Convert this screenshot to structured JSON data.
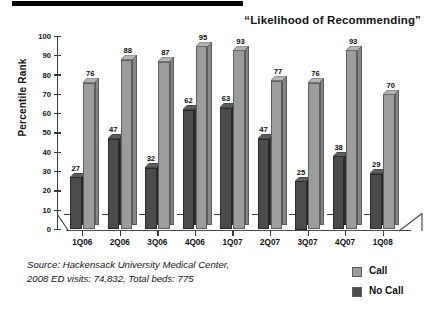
{
  "top_rule": {
    "present": true,
    "color": "#000000"
  },
  "chart_data": {
    "type": "bar",
    "title": "“Likelihood of Recommending”",
    "xlabel": "",
    "ylabel": "Percentile Rank",
    "ylim": [
      0,
      100
    ],
    "ytick_step": 10,
    "yticks": [
      "100",
      "90",
      "80",
      "70",
      "60",
      "50",
      "40",
      "30",
      "20",
      "10",
      "0"
    ],
    "grid": false,
    "legend_position": "bottom-right",
    "three_d": true,
    "categories": [
      "1Q06",
      "2Q06",
      "3Q06",
      "4Q06",
      "1Q07",
      "2Q07",
      "3Q07",
      "4Q07",
      "1Q08"
    ],
    "series": [
      {
        "name": "No Call",
        "color": "#4c4c4c",
        "values": [
          27,
          47,
          32,
          62,
          63,
          47,
          25,
          38,
          29
        ]
      },
      {
        "name": "Call",
        "color": "#9c9c9c",
        "values": [
          76,
          88,
          87,
          95,
          93,
          77,
          76,
          93,
          70
        ]
      }
    ]
  },
  "legend": {
    "items": [
      {
        "label": "Call",
        "color": "#9c9c9c"
      },
      {
        "label": "No Call",
        "color": "#4c4c4c"
      }
    ]
  },
  "source": {
    "line1": "Source: Hackensack University Medical Center,",
    "line2": "2008 ED visits: 74,832, Total beds: 775"
  }
}
